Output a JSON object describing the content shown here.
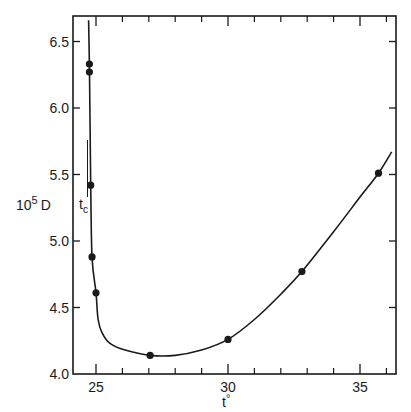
{
  "chart_data": {
    "type": "line",
    "title": "",
    "xlabel": "t°",
    "ylabel": "10⁵ D",
    "ylabel_parts": {
      "base": "10",
      "exp": "5",
      "var": "D"
    },
    "xlabel_parts": {
      "var": "t",
      "sup": "°"
    },
    "xlim": [
      24.1,
      36.4
    ],
    "ylim": [
      4.0,
      6.7
    ],
    "x_ticks_major": [
      25,
      30,
      35
    ],
    "x_ticks_minor": [
      26,
      27,
      28,
      29,
      31,
      32,
      33,
      34,
      36
    ],
    "y_ticks": [
      4.0,
      4.5,
      5.0,
      5.5,
      6.0,
      6.5
    ],
    "x_tick_labels": [
      "25",
      "30",
      "35"
    ],
    "y_tick_labels": [
      "4.0",
      "4.5",
      "5.0",
      "5.5",
      "6.0",
      "6.5"
    ],
    "grid": false,
    "legend": null,
    "annotations": [
      {
        "text": "t",
        "sub": "c",
        "x": 24.8,
        "y": 5.3,
        "note": "critical temperature marker"
      }
    ],
    "series": [
      {
        "name": "measured points",
        "style": "markers",
        "x": [
          24.75,
          24.75,
          24.8,
          24.85,
          25.0,
          27.05,
          30.0,
          32.8,
          35.7
        ],
        "y": [
          6.33,
          6.27,
          5.42,
          4.88,
          4.61,
          4.14,
          4.26,
          4.77,
          5.51
        ]
      },
      {
        "name": "fitted curve",
        "style": "line",
        "x": [
          24.72,
          24.75,
          24.8,
          24.85,
          25.0,
          25.08,
          25.23,
          25.53,
          26.1,
          27.05,
          28.0,
          29.0,
          30.0,
          31.0,
          32.0,
          32.8,
          34.0,
          35.0,
          35.7,
          36.2
        ],
        "y": [
          6.66,
          6.33,
          5.42,
          4.88,
          4.61,
          4.41,
          4.31,
          4.23,
          4.18,
          4.14,
          4.14,
          4.18,
          4.26,
          4.41,
          4.6,
          4.77,
          5.07,
          5.33,
          5.51,
          5.67
        ]
      }
    ]
  }
}
